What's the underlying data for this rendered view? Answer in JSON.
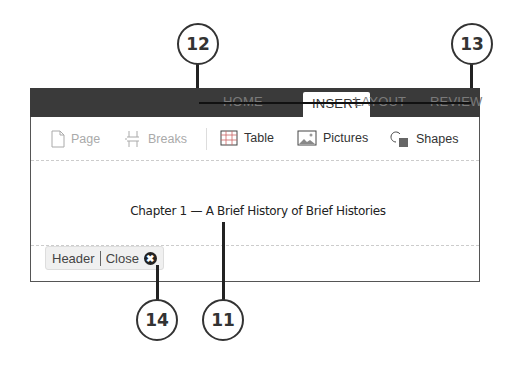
{
  "ribbon": {
    "tabs": [
      {
        "label": "HOME",
        "active": false
      },
      {
        "label": "INSERT",
        "active": true
      },
      {
        "label": "LAYOUT",
        "active": false
      },
      {
        "label": "REVIEW",
        "active": false
      }
    ]
  },
  "toolbar": {
    "items": [
      {
        "label": "Page",
        "icon": "page-icon",
        "enabled": false
      },
      {
        "label": "Breaks",
        "icon": "breaks-icon",
        "enabled": false
      },
      {
        "label": "Table",
        "icon": "table-icon",
        "enabled": true
      },
      {
        "label": "Pictures",
        "icon": "pictures-icon",
        "enabled": true
      },
      {
        "label": "Shapes",
        "icon": "shapes-icon",
        "enabled": true
      }
    ]
  },
  "document": {
    "header_text": "Chapter 1 — A Brief History of Brief Histories"
  },
  "header_bar": {
    "header_label": "Header",
    "close_label": "Close",
    "close_icon": "✖"
  },
  "callouts": {
    "c11": "11",
    "c12": "12",
    "c13": "13",
    "c14": "14"
  }
}
